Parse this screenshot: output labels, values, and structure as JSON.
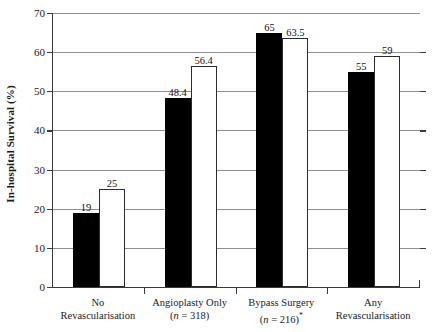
{
  "chart_data": {
    "type": "bar",
    "title": "",
    "xlabel": "",
    "ylabel": "In-hospital Survival (%)",
    "ylim": [
      0,
      70
    ],
    "ytick_step": 10,
    "yticks": [
      0,
      10,
      20,
      30,
      40,
      50,
      60,
      70
    ],
    "grid": true,
    "legend": "none",
    "categories": [
      {
        "line1": "No",
        "line2": "Revascularisation",
        "n_prefix": "",
        "n_value": "",
        "note": ""
      },
      {
        "line1": "Angioplasty Only",
        "line2": "",
        "n_prefix": "n",
        "n_value": " = 318",
        "note": ""
      },
      {
        "line1": "Bypass Surgery",
        "line2": "",
        "n_prefix": "n",
        "n_value": " = 216",
        "note": "*"
      },
      {
        "line1": "Any",
        "line2": "Revascularisation",
        "n_prefix": "",
        "n_value": "",
        "note": ""
      }
    ],
    "series": [
      {
        "name": "dark",
        "style": "filled-black",
        "color": "#000000",
        "values": [
          19,
          48.4,
          65,
          55
        ],
        "labels": [
          "19",
          "48.4",
          "65",
          "55"
        ]
      },
      {
        "name": "light",
        "style": "open-white",
        "color": "#ffffff",
        "values": [
          25,
          56.4,
          63.5,
          59
        ],
        "labels": [
          "25",
          "56.4",
          "63.5",
          "59"
        ]
      }
    ]
  },
  "axis": {
    "y_tick_labels": [
      "0",
      "10",
      "20",
      "30",
      "40",
      "50",
      "60",
      "70"
    ]
  }
}
